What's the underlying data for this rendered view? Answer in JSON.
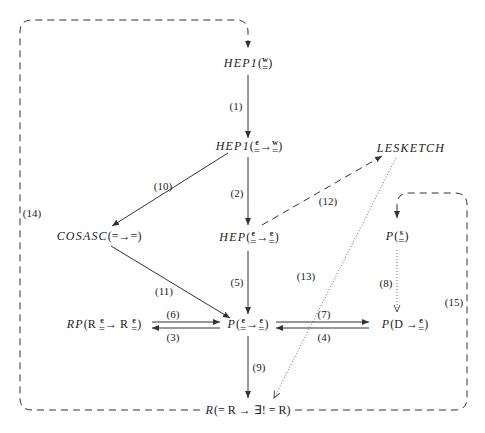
{
  "nodes": {
    "hep1_w": {
      "name": "HEP1",
      "open": "(",
      "parts": [
        {
          "sup": "w",
          "eq": "="
        }
      ],
      "close": ")"
    },
    "hep1_ew": {
      "name": "HEP1",
      "open": "(",
      "parts": [
        {
          "sup": "e",
          "eq": "="
        },
        {
          "arrow": "→"
        },
        {
          "sup": "w",
          "eq": "="
        }
      ],
      "close": ")"
    },
    "lesketch": {
      "name": "LESKETCH"
    },
    "cosasc": {
      "name": "COSASC",
      "suffix": "(=→=)"
    },
    "hep_ee": {
      "name": "HEP",
      "open": "(",
      "parts": [
        {
          "sup": "e",
          "eq": "="
        },
        {
          "arrow": "→"
        },
        {
          "sup": "e",
          "eq": "="
        }
      ],
      "close": ")"
    },
    "p_s": {
      "name": "P",
      "open": "(",
      "parts": [
        {
          "sup": "s",
          "eq": "="
        }
      ],
      "close": ")"
    },
    "rp": {
      "name": "RP",
      "open": "(R ",
      "parts": [
        {
          "sup": "e",
          "eq": "="
        },
        {
          "arrow": "→ R "
        },
        {
          "sup": "e",
          "eq": "="
        }
      ],
      "close": ")"
    },
    "p_ee": {
      "name": "P",
      "open": "(",
      "parts": [
        {
          "sup": "e",
          "eq": "="
        },
        {
          "arrow": "→"
        },
        {
          "sup": "e",
          "eq": "="
        }
      ],
      "close": ")"
    },
    "p_d": {
      "name": "P",
      "open": "(D →",
      "parts": [
        {
          "sup": "e",
          "eq": "="
        }
      ],
      "close": ")"
    },
    "r": {
      "name": "R",
      "suffix": "(= R → ∃! = R)"
    }
  },
  "edge_labels": {
    "e1": "(1)",
    "e2": "(2)",
    "e3": "(3)",
    "e4": "(4)",
    "e5": "(5)",
    "e6": "(6)",
    "e7": "(7)",
    "e8": "(8)",
    "e9": "(9)",
    "e10": "(10)",
    "e11": "(11)",
    "e12": "(12)",
    "e13": "(13)",
    "e14": "(14)",
    "e15": "(15)"
  },
  "colors": {
    "line": "#333333",
    "background": "#ffffff"
  }
}
